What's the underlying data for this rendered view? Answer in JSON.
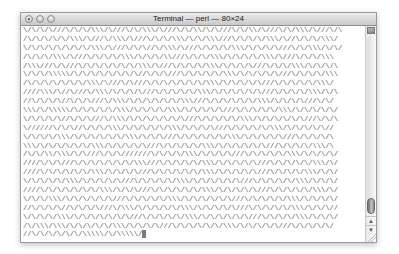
{
  "window": {
    "title": "Terminal — perl — 80×24",
    "buttons": [
      "close",
      "minimize",
      "zoom"
    ]
  },
  "terminal": {
    "columns": 80,
    "rows": 24,
    "lines": [
      "\\/\\/\\/\\///\\/\\/\\/\\\\\\/\\///\\/\\/\\\\\\/\\///\\/\\/\\\\/\\/\\///\\/\\/\\\\/\\///\\/\\/\\\\\\/\\///\\/\\",
      "/\\/\\/\\/\\/\\/\\\\\\/\\///\\/\\\\\\/\\///\\/\\/\\/\\\\\\/\\/\\/\\\\\\///\\/\\/\\/\\/\\\\\\/\\//\\/\\/\\/\\\\\\/",
      "\\/\\/\\/\\/\\/\\/\\/\\/\\\\\\/\\///\\/\\/\\//\\/\\\\\\/\\///\\/\\/\\/\\/\\\\\\/\\/\\/\\/\\///\\/\\/\\\\\\/\\/\\/",
      "/\\/\\/\\/\\\\\\/\\///\\/\\/\\/\\/\\\\\\/\\/\\/\\/\\\\///\\/\\/\\/\\\\\\/\\/\\/\\/\\/\\\\\\/\\///\\/\\/\\/\\\\\\",
      "/\\\\\\///\\/\\///\\/\\/\\/\\/\\/\\/\\/\\\\\\/\\///\\/\\/\\/\\/\\\\\\/\\/\\/\\/\\///\\/\\/\\/\\\\\\/\\/\\/\\/\\",
      "\\/\\/\\/\\\\\\\\\\/\\/\\/\\/\\/\\/\\/\\/\\//\\/\\/\\///\\/\\/\\/\\/\\/\\\\\\/\\/\\/\\/\\/\\///\\/\\/\\/\\/\\\\\\",
      "/\\/\\/\\/\\/\\/\\/\\/\\\\\\/\\///\\/\\///\\/\\/\\/\\/\\/\\/\\/\\\\\\/\\/\\/\\/\\/\\///\\/\\/\\/\\/\\/\\\\\\/",
      "////\\\\\\/\\//\\///\\/\\\\\\/\\/\\/\\/\\///\\/\\/\\/\\/\\/\\\\\\/\\/\\/\\/\\/\\/\\///\\/\\/\\/\\/\\\\\\/\\/\\",
      "//\\/\\/\\/\\//\\/\\/\\///\\/\\\\\\/\\/\\/\\/\\/\\/\\/\\\\\\///\\/\\/\\/\\/\\/\\/\\\\\\/\\/\\/\\/\\///\\/\\/",
      "\\\\\\/\\/\\\\\\\\\\/\\/\\/\\/\\/\\/\\\\\\/\\/\\/\\/\\/\\\\\\/\\/\\/\\/\\/\\///\\/\\/\\/\\/\\/\\\\\\/\\/\\/\\/\\/\\/",
      "\\/\\/\\/\\/\\//\\/\\/\\///\\/\\\\\\/\\/\\/\\/\\/\\/\\/\\///\\/\\/\\/\\/\\/\\\\\\/\\/\\/\\/\\/\\/\\///\\/\\/\\",
      "\\//////\\/\\/\\//\\/\\/\\/\\\\\\/\\/\\/\\/\\/\\/\\\\\\/\\/\\/\\/\\///\\/\\/\\/\\/\\/\\\\\\/\\/\\/\\/\\/\\//",
      "\\/\\/\\/\\/\\\\\\/\\/\\/\\/\\/\\/\\/\\\\\\/\\/\\/\\///\\/\\/\\/\\/\\/\\/\\\\\\/\\/\\/\\/\\/\\///\\/\\/\\/\\/\\",
      "\\\\\\/\\/\\/\\/\\/\\/\\/\\\\\\/\\/\\/\\/\\/\\///\\/\\/\\/\\/\\/\\\\\\/\\/\\/\\/\\/\\/\\///\\/\\/\\/\\/\\\\\\/\\",
      "/\\/\\/\\\\/\\\\\\/\\/\\///\\/\\/\\///////\\/\\/\\/\\/\\\\\\/\\/\\/\\/\\///\\/\\/\\/\\/\\/\\\\\\/\\/\\/\\/\\/",
      "////\\/\\/\\///\\/\\/\\/\\/\\/\\/\\/\\\\\\///\\/\\/\\/\\/\\/\\\\\\/\\/\\/\\/\\/\\///\\/\\/\\/\\/\\/\\\\\\/\\/",
      "////\\/\\/\\/\\/\\/\\/\\\\\\/\\/\\/\\/\\///\\/\\/\\/\\/\\/\\/\\\\\\/\\/\\/\\/\\/\\///\\/\\/\\/\\/\\\\\\/\\/\\/",
      "\\/\\/\\/\\/\\/\\\\\\/\\/\\/\\/\\/\\///\\/\\/\\/\\/\\/\\\\\\/\\/\\/\\/\\/\\/\\///\\/\\/\\/\\/\\/\\\\\\/\\/\\/\\/",
      "////\\/\\/\\/\\/\\/\\/\\/\\\\\\/\\/\\/\\///\\/\\/\\/\\/\\/\\/\\\\\\/\\/\\/\\/\\/\\///\\/\\/\\/\\/\\/\\\\\\/\\/",
      "\\/\\/\\/\\\\\\/\\/\\/\\/\\/\\/\\///\\/\\/\\/\\/\\/\\\\\\/\\/\\/\\/\\/\\/\\///\\/\\/\\/\\/\\/\\\\\\/\\/\\/\\/\\/",
      "//\\/\\/\\/\\//\\/\\/\\/\\///\\/\\\\\\/\\/\\/\\/\\/\\/\\\\\\/\\/\\/\\/\\/\\///\\/\\/\\/\\/\\/\\\\\\/\\/\\/\\//",
      "\\/\\/\\/\\/\\\\\\/\\/\\/\\/\\/\\/\\/\\///\\/\\/\\/\\/\\/\\\\\\/\\/\\/\\/\\/\\/\\///\\/\\/\\/\\/\\\\\\/\\/\\/\\/",
      "/\\/\\\\\\/\\\\\\/\\/\\/\\/\\/\\/\\\\\\/\\/\\/\\/\\///\\/\\/\\/\\/\\/\\/\\\\\\/\\/\\/\\/\\/\\///\\/\\/\\/\\/\\/",
      "//\\/\\/\\/\\/\\/\\/\\\\\\\\\\/\\/\\\\\\\\\\/"
    ]
  },
  "scrollbar": {
    "up_arrow": "▲",
    "down_arrow": "▼"
  }
}
